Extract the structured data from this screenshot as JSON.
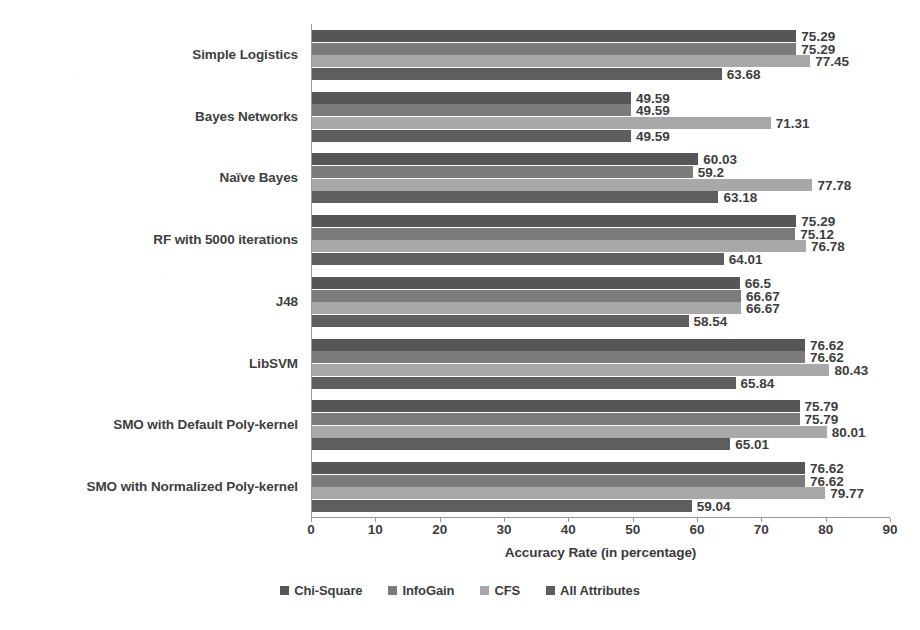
{
  "chart_data": {
    "type": "bar",
    "orientation": "horizontal",
    "title": "",
    "xlabel": "Accuracy Rate (in percentage)",
    "ylabel": "",
    "xlim": [
      0,
      90
    ],
    "xticks": [
      0,
      10,
      20,
      30,
      40,
      50,
      60,
      70,
      80,
      90
    ],
    "grid": false,
    "legend_position": "bottom",
    "categories": [
      "Simple Logistics",
      "Bayes Networks",
      "Naïve Bayes",
      "RF with 5000 iterations",
      "J48",
      "LibSVM",
      "SMO with Default Poly-kernel",
      "SMO with Normalized Poly-kernel"
    ],
    "series": [
      {
        "name": "Chi-Square",
        "color": "#565656",
        "values": [
          75.29,
          49.59,
          60.03,
          75.29,
          66.5,
          76.62,
          75.79,
          76.62
        ]
      },
      {
        "name": "InfoGain",
        "color": "#7b7b7b",
        "values": [
          75.29,
          49.59,
          59.2,
          75.12,
          66.67,
          76.62,
          75.79,
          76.62
        ]
      },
      {
        "name": "CFS",
        "color": "#a8a8a8",
        "values": [
          77.45,
          71.31,
          77.78,
          76.78,
          66.67,
          80.43,
          80.01,
          79.77
        ]
      },
      {
        "name": "All Attributes",
        "color": "#5e5e5e",
        "values": [
          63.68,
          49.59,
          63.18,
          64.01,
          58.54,
          65.84,
          65.01,
          59.04
        ]
      }
    ],
    "value_labels": [
      [
        "75.29",
        "75.29",
        "77.45",
        "63.68"
      ],
      [
        "49.59",
        "49.59",
        "71.31",
        "49.59"
      ],
      [
        "60.03",
        "59.2",
        "77.78",
        "63.18"
      ],
      [
        "75.29",
        "75.12",
        "76.78",
        "64.01"
      ],
      [
        "66.5",
        "66.67",
        "66.67",
        "58.54"
      ],
      [
        "76.62",
        "76.62",
        "80.43",
        "65.84"
      ],
      [
        "75.79",
        "75.79",
        "80.01",
        "65.01"
      ],
      [
        "76.62",
        "76.62",
        "79.77",
        "59.04"
      ]
    ]
  },
  "legend": {
    "items": [
      {
        "label": "Chi-Square"
      },
      {
        "label": "InfoGain"
      },
      {
        "label": "CFS"
      },
      {
        "label": "All Attributes"
      }
    ]
  }
}
